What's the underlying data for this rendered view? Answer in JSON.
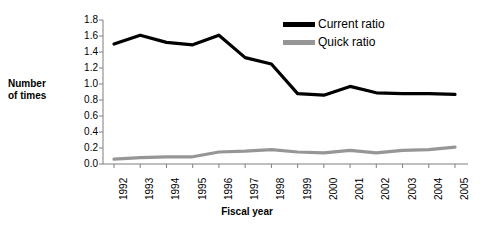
{
  "chart_data": {
    "type": "line",
    "title": "",
    "xlabel": "Fiscal year",
    "ylabel": "Number of times",
    "ylabel_line1": "Number",
    "ylabel_line2": "of times",
    "categories": [
      "1992",
      "1993",
      "1994",
      "1995",
      "1996",
      "1997",
      "1998",
      "1999",
      "2000",
      "2001",
      "2002",
      "2003",
      "2004",
      "2005"
    ],
    "x": [
      1992,
      1993,
      1994,
      1995,
      1996,
      1997,
      1998,
      1999,
      2000,
      2001,
      2002,
      2003,
      2004,
      2005
    ],
    "ylim": [
      0.0,
      1.8
    ],
    "ytick_labels": [
      "1.8",
      "1.6",
      "1.4",
      "1.2",
      "1.0",
      "0.8",
      "0.6",
      "0.4",
      "0.2",
      "0.0"
    ],
    "ytick_values": [
      1.8,
      1.6,
      1.4,
      1.2,
      1.0,
      0.8,
      0.6,
      0.4,
      0.2,
      0.0
    ],
    "grid": false,
    "legend_position": "top-right",
    "series": [
      {
        "name": "Current ratio",
        "color": "#000000",
        "values": [
          1.5,
          1.61,
          1.52,
          1.49,
          1.61,
          1.33,
          1.25,
          0.88,
          0.86,
          0.97,
          0.89,
          0.88,
          0.88,
          0.87
        ]
      },
      {
        "name": "Quick ratio",
        "color": "#969696",
        "values": [
          0.06,
          0.08,
          0.09,
          0.09,
          0.15,
          0.16,
          0.18,
          0.15,
          0.14,
          0.17,
          0.14,
          0.17,
          0.18,
          0.21
        ]
      }
    ]
  },
  "legend": {
    "items": [
      {
        "label": "Current ratio",
        "color": "#000000"
      },
      {
        "label": "Quick ratio",
        "color": "#969696"
      }
    ]
  }
}
